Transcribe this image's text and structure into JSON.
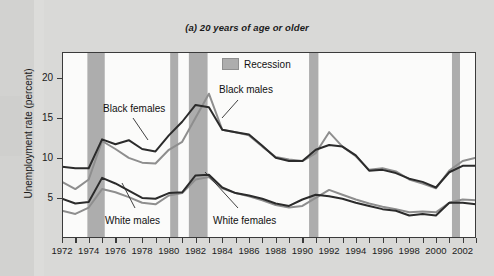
{
  "figure": {
    "title": "(a) 20 years of age or older",
    "ylabel": "Unemployment rate (percent)"
  },
  "legend": {
    "recession_label": "Recession",
    "recession_color": "#adadad"
  },
  "annotations": {
    "black_females": "Black females",
    "black_males": "Black males",
    "white_males": "White males",
    "white_females": "White females"
  },
  "chart_data": {
    "type": "line",
    "title": "(a) 20 years of age or older",
    "xlabel": "",
    "ylabel": "Unemployment rate (percent)",
    "xlim": [
      1972,
      2003
    ],
    "ylim": [
      0,
      23.2
    ],
    "yticks": [
      5,
      10,
      15,
      20
    ],
    "xticks": [
      1972,
      1973,
      1974,
      1975,
      1976,
      1977,
      1978,
      1979,
      1980,
      1981,
      1982,
      1983,
      1984,
      1985,
      1986,
      1987,
      1988,
      1989,
      1990,
      1991,
      1992,
      1993,
      1994,
      1995,
      1996,
      1997,
      1998,
      1999,
      2000,
      2001,
      2002,
      2003
    ],
    "xtick_labels": [
      "1972",
      "",
      "1974",
      "",
      "1976",
      "",
      "1978",
      "",
      "1980",
      "",
      "1982",
      "",
      "1984",
      "",
      "1986",
      "",
      "1988",
      "",
      "1990",
      "",
      "1992",
      "",
      "1994",
      "",
      "1996",
      "",
      "1998",
      "",
      "2000",
      "",
      "2002",
      ""
    ],
    "grid": false,
    "legend_position": "top-center",
    "x": [
      1972,
      1973,
      1974,
      1975,
      1976,
      1977,
      1978,
      1979,
      1980,
      1981,
      1982,
      1983,
      1984,
      1985,
      1986,
      1987,
      1988,
      1989,
      1990,
      1991,
      1992,
      1993,
      1994,
      1995,
      1996,
      1997,
      1998,
      1999,
      2000,
      2001,
      2002,
      2003
    ],
    "series": [
      {
        "name": "Black males",
        "color": "#2b2b2b",
        "values": [
          8.9,
          8.7,
          8.7,
          12.3,
          11.7,
          12.2,
          11.1,
          10.8,
          12.8,
          14.5,
          16.6,
          16.3,
          13.5,
          13.2,
          12.9,
          11.5,
          10.0,
          9.6,
          9.6,
          11.0,
          11.6,
          11.4,
          10.3,
          8.4,
          8.5,
          8.1,
          7.4,
          7.0,
          6.3,
          8.2,
          9.0,
          9.0
        ]
      },
      {
        "name": "Black females",
        "color": "#8e8e8e",
        "values": [
          7.0,
          6.1,
          7.3,
          12.1,
          11.1,
          10.0,
          9.4,
          9.3,
          11.0,
          12.0,
          15.0,
          18.0,
          13.5,
          13.2,
          12.8,
          11.4,
          10.1,
          9.8,
          9.6,
          10.6,
          13.2,
          11.4,
          10.2,
          8.5,
          8.7,
          8.3,
          7.3,
          6.8,
          6.2,
          8.4,
          9.6,
          10.0
        ]
      },
      {
        "name": "White males",
        "color": "#2b2b2b",
        "values": [
          4.9,
          4.3,
          4.5,
          7.5,
          6.8,
          5.9,
          5.0,
          4.9,
          5.6,
          5.7,
          7.8,
          7.9,
          6.3,
          5.6,
          5.3,
          4.9,
          4.3,
          4.0,
          4.8,
          5.4,
          5.2,
          4.9,
          4.4,
          4.0,
          3.6,
          3.4,
          2.8,
          3.0,
          2.8,
          4.4,
          4.4,
          4.2
        ]
      },
      {
        "name": "White females",
        "color": "#8e8e8e",
        "values": [
          3.4,
          3.0,
          3.8,
          6.1,
          5.7,
          5.1,
          4.4,
          4.2,
          5.3,
          5.6,
          7.3,
          7.6,
          6.2,
          5.6,
          5.2,
          4.7,
          4.1,
          3.8,
          4.0,
          5.0,
          6.0,
          5.4,
          4.8,
          4.3,
          3.9,
          3.6,
          3.2,
          3.3,
          3.2,
          4.4,
          4.8,
          4.7
        ]
      }
    ],
    "recession_bands": [
      {
        "start": 1973.9,
        "end": 1975.2
      },
      {
        "start": 1980.1,
        "end": 1980.7
      },
      {
        "start": 1981.5,
        "end": 1982.9
      },
      {
        "start": 1990.5,
        "end": 1991.2
      },
      {
        "start": 2001.2,
        "end": 2001.8
      }
    ]
  }
}
